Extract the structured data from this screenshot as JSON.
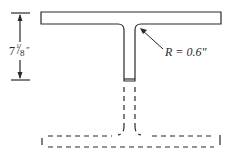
{
  "diagram": {
    "type": "structural T-section (tee cut from I-beam)",
    "dimension": {
      "whole": "7",
      "fraction_num": "1",
      "fraction_den": "8",
      "unit": "″"
    },
    "fillet": {
      "label": "R = 0.6″"
    },
    "colors": {
      "stroke": "#2a2a2a",
      "background": "#ffffff"
    }
  }
}
